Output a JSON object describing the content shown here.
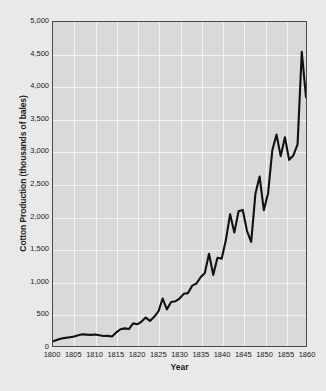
{
  "chart_data": {
    "type": "line",
    "title": "",
    "xlabel": "Year",
    "ylabel": "Cotton Production (thousands of bales)",
    "xlim": [
      1800,
      1860
    ],
    "ylim": [
      0,
      5000
    ],
    "grid": true,
    "legend": null,
    "xticks": [
      1800,
      1805,
      1810,
      1815,
      1820,
      1825,
      1830,
      1835,
      1840,
      1845,
      1850,
      1855,
      1860
    ],
    "xtick_labels": [
      "1800",
      "1805",
      "1810",
      "1815",
      "1820",
      "1825",
      "1830",
      "1835",
      "1840",
      "1845",
      "1850",
      "1855",
      "1860"
    ],
    "yticks": [
      0,
      500,
      1000,
      1500,
      2000,
      2500,
      3000,
      3500,
      4000,
      4500,
      5000
    ],
    "ytick_labels": [
      "0",
      "500",
      "1,000",
      "1,500",
      "2,000",
      "2,500",
      "3,000",
      "3,500",
      "4,000",
      "4,500",
      "5,000"
    ],
    "series_name": "Cotton Production",
    "line_color": "#111111",
    "plot_background": "#d9d9d9",
    "page_background": "#e9e9e9",
    "gridline_color": "#f4f4f4",
    "axis_color": "#4a4a4a",
    "x": [
      1800,
      1801,
      1802,
      1803,
      1804,
      1805,
      1806,
      1807,
      1808,
      1809,
      1810,
      1811,
      1812,
      1813,
      1814,
      1815,
      1816,
      1817,
      1818,
      1819,
      1820,
      1821,
      1822,
      1823,
      1824,
      1825,
      1826,
      1827,
      1828,
      1829,
      1830,
      1831,
      1832,
      1833,
      1834,
      1835,
      1836,
      1837,
      1838,
      1839,
      1840,
      1841,
      1842,
      1843,
      1844,
      1845,
      1846,
      1847,
      1848,
      1849,
      1850,
      1851,
      1852,
      1853,
      1854,
      1855,
      1856,
      1857,
      1858,
      1859,
      1860
    ],
    "values": [
      73,
      96,
      115,
      125,
      135,
      146,
      167,
      180,
      175,
      172,
      178,
      167,
      155,
      156,
      146,
      209,
      259,
      272,
      261,
      349,
      335,
      377,
      439,
      387,
      450,
      533,
      732,
      565,
      680,
      690,
      732,
      805,
      816,
      931,
      962,
      1061,
      1128,
      1423,
      1098,
      1361,
      1348,
      1635,
      2035,
      1750,
      2078,
      2100,
      1778,
      1606,
      2348,
      2615,
      2096,
      2355,
      3016,
      3263,
      2930,
      3221,
      2873,
      2940,
      3113,
      4541,
      3841
    ]
  },
  "caption": {
    "note": ""
  }
}
